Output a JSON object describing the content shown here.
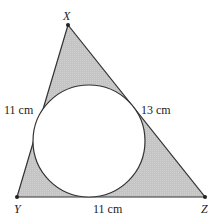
{
  "diagram": {
    "type": "triangle-with-inscribed-circle",
    "vertices": {
      "X": {
        "label": "X",
        "x": 68,
        "y": 25
      },
      "Y": {
        "label": "Y",
        "x": 17,
        "y": 197
      },
      "Z": {
        "label": "Z",
        "x": 205,
        "y": 197
      }
    },
    "side_labels": {
      "XY": "11 cm",
      "XZ": "13 cm",
      "YZ": "11 cm"
    },
    "circle": {
      "cx": 89,
      "cy": 141,
      "r": 56
    },
    "colors": {
      "shaded_region": "#c8c8c8",
      "stroke": "#333333",
      "circle_fill": "#ffffff"
    }
  }
}
